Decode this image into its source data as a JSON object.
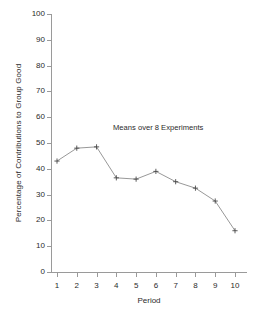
{
  "chart_data": {
    "type": "line",
    "title": "",
    "annotation": "Means over 8 Experiments",
    "xlabel": "Period",
    "ylabel": "Percentage of Contributions to Group Good",
    "x": [
      1,
      2,
      3,
      4,
      5,
      6,
      7,
      8,
      9,
      10
    ],
    "categories": [
      "1",
      "2",
      "3",
      "4",
      "5",
      "6",
      "7",
      "8",
      "9",
      "10"
    ],
    "values": [
      43,
      48,
      48.5,
      36.5,
      36,
      39,
      35,
      32.5,
      27.5,
      16
    ],
    "series": [
      {
        "name": "Means over 8 Experiments",
        "values": [
          43,
          48,
          48.5,
          36.5,
          36,
          39,
          35,
          32.5,
          27.5,
          16
        ]
      }
    ],
    "xlim": [
      1,
      10
    ],
    "ylim": [
      0,
      100
    ],
    "yticks": [
      0,
      10,
      20,
      30,
      40,
      50,
      60,
      70,
      80,
      90,
      100
    ],
    "ytick_labels": [
      "0",
      "10",
      "20",
      "30",
      "40",
      "50",
      "60",
      "70",
      "80",
      "90",
      "100"
    ],
    "xticks": [
      1,
      2,
      3,
      4,
      5,
      6,
      7,
      8,
      9,
      10
    ],
    "xtick_labels": [
      "1",
      "2",
      "3",
      "4",
      "5",
      "6",
      "7",
      "8",
      "9",
      "10"
    ],
    "grid": false,
    "legend": false,
    "legend_position": "none",
    "marker": "plus",
    "line_color": "#8c8c8c",
    "marker_color": "#4a4a4a",
    "axis_color": "#9a9a9a",
    "text_color": "#2b2b2b",
    "background_color": "#ffffff"
  }
}
